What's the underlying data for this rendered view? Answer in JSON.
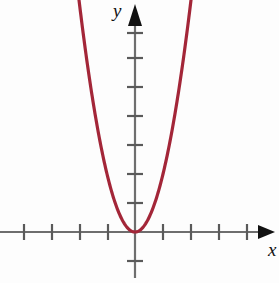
{
  "figure": {
    "background_color": "#fdfdfd",
    "axis_color": "#6e6e6e",
    "arrow_color": "#111111",
    "curve_color": "#A32638",
    "curve_width": 3.2
  },
  "labels": {
    "y_axis": "y",
    "x_axis": "x"
  },
  "chart_data": {
    "type": "line",
    "title": "",
    "xlabel": "x",
    "ylabel": "y",
    "grid": false,
    "legend": false,
    "function": "y = 2x^2",
    "vertex": [
      0,
      0
    ],
    "xlim": [
      -4.8,
      4.1
    ],
    "ylim": [
      -1.0,
      7.7
    ],
    "axis_ticks": {
      "x": [
        -4,
        -3,
        -2,
        -1,
        1,
        2,
        3,
        4
      ],
      "y": [
        -1,
        1,
        2,
        3,
        4,
        5,
        6,
        7
      ],
      "labeled": false,
      "x_tick_count_left": 4,
      "x_tick_count_right": 4,
      "y_tick_count_above": 7,
      "y_tick_count_below": 1
    },
    "x": [
      -2.0,
      -1.8,
      -1.6,
      -1.4,
      -1.2,
      -1.0,
      -0.8,
      -0.6,
      -0.4,
      -0.2,
      0.0,
      0.2,
      0.4,
      0.6,
      0.8,
      1.0,
      1.2,
      1.4,
      1.6,
      1.8,
      2.0
    ],
    "values": [
      8.0,
      6.48,
      5.12,
      3.92,
      2.88,
      2.0,
      1.28,
      0.72,
      0.32,
      0.08,
      0.0,
      0.08,
      0.32,
      0.72,
      1.28,
      2.0,
      2.88,
      3.92,
      5.12,
      6.48,
      8.0
    ],
    "series": [
      {
        "name": "y = 2x^2",
        "color": "#A32638",
        "values": [
          8.0,
          6.48,
          5.12,
          3.92,
          2.88,
          2.0,
          1.28,
          0.72,
          0.32,
          0.08,
          0.0,
          0.08,
          0.32,
          0.72,
          1.28,
          2.0,
          2.88,
          3.92,
          5.12,
          6.48,
          8.0
        ]
      }
    ]
  },
  "geometry": {
    "origin_x": 135,
    "origin_y": 232,
    "unit_x": 28,
    "unit_y": 29
  }
}
